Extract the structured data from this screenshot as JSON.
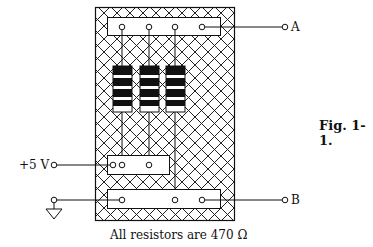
{
  "figure": {
    "label": "Fig. 1-1.",
    "caption": "All resistors are 470 Ω"
  },
  "terminals": {
    "a": "A",
    "b": "B",
    "supply": "+5 V",
    "ground": "ground"
  },
  "board": {
    "resistor_count": 3,
    "pattern": "crosshatch"
  }
}
